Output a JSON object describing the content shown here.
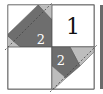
{
  "diagram": {
    "type": "quilt-block-piecing",
    "colors": {
      "background": "#ffffff",
      "outline": "#555555",
      "dark_piece": "#6e6e6e",
      "light_piece": "#bdbdbd",
      "stitch_line": "#444444",
      "right_border": "#6a6a6a"
    },
    "pieces": [
      {
        "id": "unit-1",
        "label": "1",
        "position": "top-right"
      },
      {
        "id": "unit-2a",
        "label": "2",
        "position": "top-left"
      },
      {
        "id": "unit-2b",
        "label": "2",
        "position": "bottom-right"
      }
    ]
  }
}
